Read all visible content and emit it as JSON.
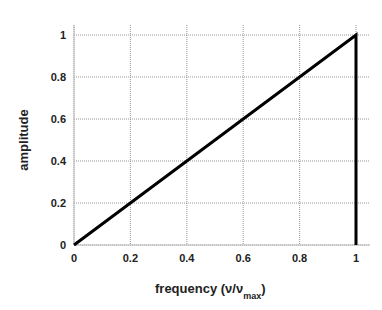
{
  "chart_data": {
    "type": "line",
    "title": "",
    "xlabel": "frequency (ν/ν",
    "xlabel_sub": "max",
    "xlabel_close": ")",
    "ylabel": "amplitude",
    "xlim": [
      0,
      1
    ],
    "ylim": [
      0,
      1
    ],
    "grid": true,
    "legend": null,
    "x_ticks": [
      "0",
      "0.2",
      "0.4",
      "0.6",
      "0.8",
      "1"
    ],
    "y_ticks": [
      "0",
      "0.2",
      "0.4",
      "0.6",
      "0.8",
      "1"
    ],
    "series": [
      {
        "name": "amplitude",
        "x": [
          0,
          1,
          1
        ],
        "y": [
          0,
          1,
          0
        ],
        "color": "#000000"
      }
    ]
  }
}
